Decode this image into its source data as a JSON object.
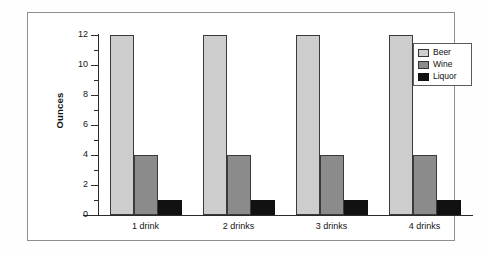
{
  "chart_data": {
    "type": "bar",
    "title": "",
    "subtitle": "",
    "xlabel": "",
    "ylabel": "Ounces",
    "categories": [
      "1 drink",
      "2 drinks",
      "3 drinks",
      "4 drinks"
    ],
    "series": [
      {
        "name": "Beer",
        "color": "#cdcdcd",
        "values": [
          12,
          12,
          12,
          12
        ]
      },
      {
        "name": "Wine",
        "color": "#8b8b8b",
        "values": [
          4,
          4,
          4,
          4
        ]
      },
      {
        "name": "Liquor",
        "color": "#111111",
        "values": [
          1,
          1,
          1,
          1
        ]
      }
    ],
    "ylim": [
      0,
      12
    ],
    "ytick_labels": [
      "0",
      "2",
      "4",
      "6",
      "8",
      "10",
      "12"
    ],
    "ytick_values": [
      0,
      2,
      4,
      6,
      8,
      10,
      12
    ],
    "yminor_values": [
      1,
      3,
      5,
      7,
      9,
      11
    ],
    "grid": false,
    "legend_position": "top-right",
    "legend_entries": [
      "Beer",
      "Wine",
      "Liquor"
    ]
  },
  "figure": {
    "frame_color": "#8d8d93",
    "axis_color": "#2b2b2b",
    "background": "#ffffff"
  }
}
